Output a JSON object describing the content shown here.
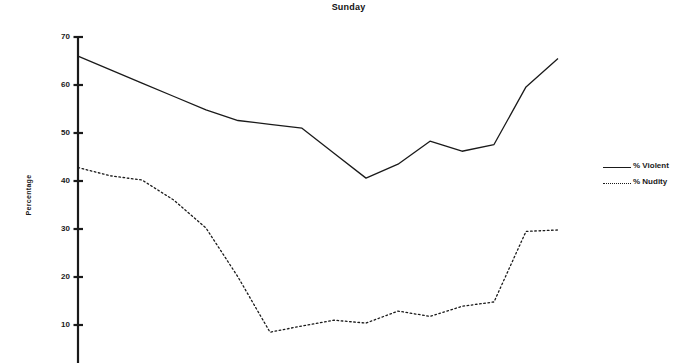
{
  "chart_data": {
    "type": "line",
    "title": "Sunday",
    "xlabel": "",
    "ylabel": "Percentage",
    "ylim": [
      0,
      70
    ],
    "yticks": [
      70,
      60,
      50,
      40,
      30,
      20,
      10
    ],
    "xlim": [
      0,
      15
    ],
    "x": [
      0,
      1,
      2,
      3,
      4,
      5,
      6,
      7,
      8,
      9,
      10,
      11,
      12,
      13,
      14,
      15
    ],
    "grid": false,
    "legend_position": "right",
    "series": [
      {
        "name": "% Violent",
        "style": "solid",
        "color": "#1a1a1a",
        "values": [
          66.0,
          63.2,
          60.4,
          57.6,
          54.8,
          52.6,
          51.8,
          51.0,
          45.8,
          40.6,
          43.5,
          48.3,
          46.2,
          47.6,
          59.6,
          65.5
        ]
      },
      {
        "name": "% Nudity",
        "style": "dotted",
        "color": "#1a1a1a",
        "values": [
          42.8,
          41.1,
          40.2,
          36.0,
          30.2,
          20.0,
          8.5,
          9.8,
          11.0,
          10.4,
          12.9,
          11.8,
          13.9,
          14.8,
          29.5,
          29.8
        ]
      }
    ]
  },
  "legend": {
    "items": [
      {
        "label": "% Violent",
        "style": "solid"
      },
      {
        "label": "% Nudity",
        "style": "dotted"
      }
    ]
  },
  "axis": {
    "y_tick_labels": [
      "70",
      "60",
      "50",
      "40",
      "30",
      "20",
      "10"
    ],
    "y_axis_title": "Percentage"
  }
}
